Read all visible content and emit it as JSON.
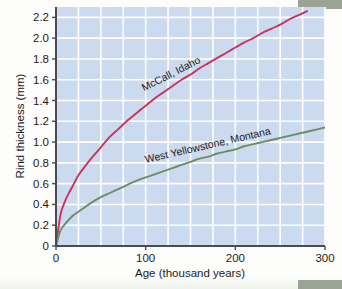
{
  "chart_data": {
    "type": "line",
    "title": "",
    "xlabel": "Age (thousand years)",
    "ylabel": "Rind thickness (mm)",
    "xlim": [
      0,
      300
    ],
    "ylim": [
      0,
      2.3
    ],
    "xticks": [
      "0",
      "100",
      "200",
      "300"
    ],
    "xtick_values": [
      0,
      100,
      200,
      300
    ],
    "yticks": [
      "0",
      "0.2",
      "0.4",
      "0.6",
      "0.8",
      "1.0",
      "1.2",
      "1.4",
      "1.6",
      "1.8",
      "2.0",
      "2.2"
    ],
    "ytick_values": [
      0,
      0.2,
      0.4,
      0.6,
      0.8,
      1.0,
      1.2,
      1.4,
      1.6,
      1.8,
      2.0,
      2.2
    ],
    "grid": true,
    "grid_x_step": 25,
    "grid_y_step": 0.2,
    "legend_position": "inline-on-curve",
    "plot_background": "#ccdaf0",
    "grid_color": "#ffffff",
    "series": [
      {
        "name": "McCall, Idaho",
        "color": "#c9335a",
        "label_angle": -27,
        "x": [
          0,
          5,
          10,
          15,
          20,
          25,
          30,
          40,
          50,
          60,
          70,
          80,
          90,
          100,
          110,
          120,
          130,
          140,
          150,
          160,
          170,
          180,
          190,
          200,
          210,
          220,
          230,
          240,
          250,
          260,
          270,
          280
        ],
        "values": [
          0,
          0.3,
          0.43,
          0.52,
          0.6,
          0.68,
          0.74,
          0.85,
          0.95,
          1.05,
          1.13,
          1.21,
          1.28,
          1.35,
          1.42,
          1.48,
          1.54,
          1.6,
          1.65,
          1.71,
          1.76,
          1.81,
          1.86,
          1.91,
          1.96,
          2.0,
          2.05,
          2.09,
          2.13,
          2.18,
          2.22,
          2.26
        ]
      },
      {
        "name": "West Yellowstone, Montana",
        "color": "#6c8f62",
        "label_angle": -13,
        "x": [
          0,
          5,
          10,
          15,
          20,
          25,
          30,
          40,
          50,
          60,
          70,
          80,
          90,
          100,
          110,
          120,
          130,
          140,
          150,
          160,
          170,
          180,
          190,
          200,
          210,
          220,
          230,
          240,
          250,
          260,
          270,
          280,
          290,
          300
        ],
        "values": [
          0,
          0.15,
          0.21,
          0.26,
          0.3,
          0.33,
          0.36,
          0.42,
          0.47,
          0.51,
          0.55,
          0.59,
          0.63,
          0.66,
          0.69,
          0.72,
          0.75,
          0.78,
          0.81,
          0.84,
          0.86,
          0.89,
          0.91,
          0.93,
          0.96,
          0.98,
          1.0,
          1.02,
          1.04,
          1.06,
          1.08,
          1.1,
          1.12,
          1.14
        ]
      }
    ]
  }
}
